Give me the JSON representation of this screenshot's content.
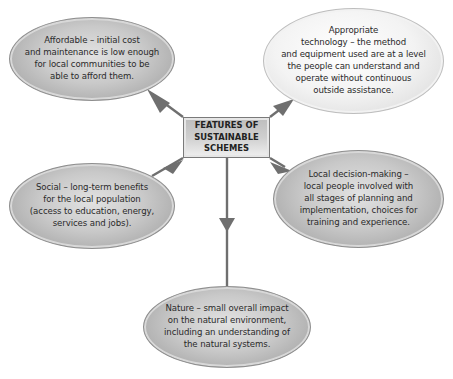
{
  "diagram": {
    "center": {
      "title": "FEATURES OF\nSUSTAINABLE\nSCHEMES"
    },
    "features": [
      {
        "id": "affordable",
        "text": "Affordable – initial cost\nand maintenance is low enough\nfor local communities to be\nable to afford them."
      },
      {
        "id": "appropriate-technology",
        "text": "Appropriate\ntechnology – the method\nand equipment used are at a level\nthe people can understand and\noperate without continuous\noutside assistance."
      },
      {
        "id": "social",
        "text": "Social – long-term benefits\nfor the local population\n(access to education, energy,\nservices and jobs)."
      },
      {
        "id": "local-decision-making",
        "text": "Local decision-making –\nlocal people involved with\nall stages of planning and\nimplementation, choices for\ntraining and experience."
      },
      {
        "id": "nature",
        "text": "Nature – small overall impact\non the natural environment,\nincluding an understanding of\nthe natural systems."
      }
    ],
    "colors": {
      "arrow": "#6f6f6f",
      "bubble_dark": "#b5b5b5",
      "bubble_light": "#f3f3f3",
      "box": "#cfcfcf"
    }
  }
}
